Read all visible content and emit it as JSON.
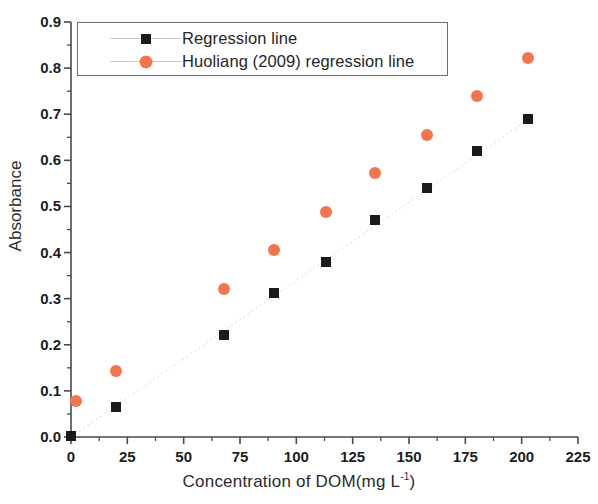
{
  "chart_data": {
    "type": "scatter",
    "title": "",
    "xlabel": "Concentration of DOM(mg L",
    "xlabel_sup": "-1",
    "xlabel_tail": ")",
    "ylabel": "Absorbance",
    "xlim": [
      0,
      225
    ],
    "ylim": [
      0.0,
      0.9
    ],
    "xticks": [
      0,
      25,
      50,
      75,
      100,
      125,
      150,
      175,
      200,
      225
    ],
    "xtick_labels": [
      "0",
      "25",
      "50",
      "75",
      "100",
      "125",
      "150",
      "175",
      "200",
      "225"
    ],
    "yticks": [
      0.0,
      0.1,
      0.2,
      0.3,
      0.4,
      0.5,
      0.6,
      0.7,
      0.8,
      0.9
    ],
    "ytick_labels": [
      "0.0",
      "0.1",
      "0.2",
      "0.3",
      "0.4",
      "0.5",
      "0.6",
      "0.7",
      "0.8",
      "0.9"
    ],
    "minor_ticks": true,
    "grid": false,
    "legend_position": "upper-left",
    "series": [
      {
        "name": "Regression line",
        "marker": "square",
        "color": "#1b1b1b",
        "x": [
          0,
          20,
          68,
          90,
          113,
          135,
          158,
          180,
          203
        ],
        "y": [
          0.002,
          0.065,
          0.222,
          0.312,
          0.38,
          0.471,
          0.54,
          0.621,
          0.689
        ]
      },
      {
        "name": "Huoliang (2009) regression line",
        "marker": "circle",
        "color": "#f4744e",
        "x": [
          2,
          20,
          68,
          90,
          113,
          135,
          158,
          180,
          203
        ],
        "y": [
          0.077,
          0.143,
          0.322,
          0.406,
          0.487,
          0.572,
          0.655,
          0.74,
          0.823
        ]
      }
    ],
    "trendline": {
      "visible": true,
      "style": "faint-dotted",
      "color": "#d8d8d8",
      "from": [
        0,
        0.0
      ],
      "to": [
        203,
        0.689
      ]
    }
  },
  "legend": {
    "entries": [
      {
        "label": "Regression line"
      },
      {
        "label": "Huoliang (2009) regression line"
      }
    ]
  }
}
